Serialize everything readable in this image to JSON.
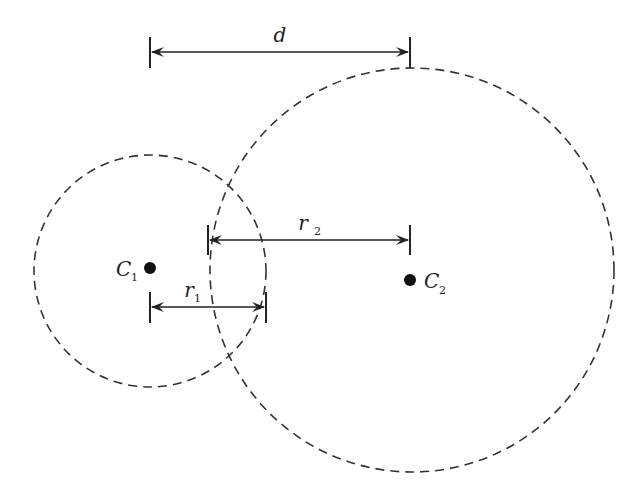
{
  "diagram": {
    "type": "two-intersecting-circles",
    "stroke_color": "#333333",
    "circles": [
      {
        "id": "circle-1",
        "center_label": "C",
        "center_sub": "1",
        "cx": 150,
        "cy": 268,
        "r": 116,
        "style": "dashed"
      },
      {
        "id": "circle-2",
        "center_label": "C",
        "center_sub": "2",
        "cx": 410,
        "cy": 270,
        "r": 203,
        "style": "dashed"
      }
    ],
    "dimensions": [
      {
        "id": "distance",
        "label": "d",
        "label_sub": "",
        "x1": 150,
        "x2": 410,
        "y": 52
      },
      {
        "id": "radius-2",
        "label": "r",
        "label_sub": "2",
        "x1": 208,
        "x2": 410,
        "y": 240
      },
      {
        "id": "radius-1",
        "label": "r",
        "label_sub": "1",
        "x1": 150,
        "x2": 267,
        "y": 307
      }
    ]
  }
}
